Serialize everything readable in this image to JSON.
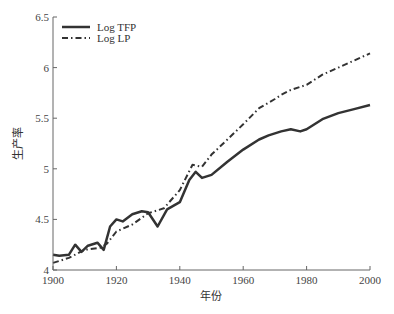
{
  "chart_data": {
    "type": "line",
    "title": "",
    "xlabel": "年份",
    "ylabel": "生产率",
    "xlim": [
      1900,
      2000
    ],
    "ylim": [
      4,
      6.5
    ],
    "xticks": [
      1900,
      1920,
      1940,
      1960,
      1980,
      2000
    ],
    "yticks": [
      4,
      4.5,
      5,
      5.5,
      6,
      6.5
    ],
    "ytick_labels": [
      "4",
      "4.5",
      "5",
      "5.5",
      "6",
      "6.5"
    ],
    "grid": false,
    "legend_position": "upper left",
    "series": [
      {
        "name": "Log TFP",
        "style": "solid",
        "color": "#333333",
        "x": [
          1900,
          1902,
          1905,
          1907,
          1909,
          1911,
          1914,
          1916,
          1918,
          1920,
          1922,
          1925,
          1928,
          1930,
          1933,
          1936,
          1940,
          1943,
          1945,
          1947,
          1950,
          1955,
          1960,
          1965,
          1968,
          1972,
          1975,
          1978,
          1980,
          1985,
          1990,
          1995,
          2000
        ],
        "values": [
          4.15,
          4.14,
          4.15,
          4.25,
          4.18,
          4.24,
          4.27,
          4.2,
          4.43,
          4.5,
          4.48,
          4.55,
          4.58,
          4.57,
          4.43,
          4.6,
          4.67,
          4.89,
          4.97,
          4.91,
          4.94,
          5.07,
          5.19,
          5.29,
          5.33,
          5.37,
          5.39,
          5.37,
          5.39,
          5.49,
          5.55,
          5.59,
          5.63
        ]
      },
      {
        "name": "Log LP",
        "style": "dash-dot",
        "color": "#333333",
        "x": [
          1900,
          1905,
          1910,
          1915,
          1917,
          1920,
          1925,
          1930,
          1933,
          1935,
          1940,
          1944,
          1947,
          1950,
          1955,
          1960,
          1965,
          1970,
          1972,
          1975,
          1980,
          1985,
          1990,
          1995,
          2000
        ],
        "values": [
          4.07,
          4.12,
          4.2,
          4.22,
          4.26,
          4.38,
          4.45,
          4.56,
          4.59,
          4.61,
          4.79,
          5.04,
          5.02,
          5.14,
          5.29,
          5.44,
          5.6,
          5.69,
          5.73,
          5.78,
          5.83,
          5.93,
          6.0,
          6.07,
          6.14
        ]
      }
    ]
  }
}
